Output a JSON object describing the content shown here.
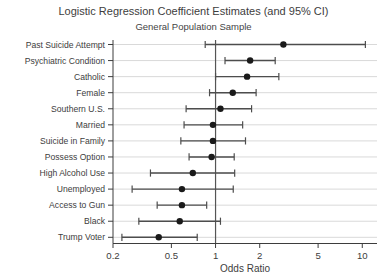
{
  "chart_data": {
    "type": "scatter",
    "subtype": "forest-plot",
    "title": "Logistic Regression Coefficient Estimates (and 95% CI)",
    "subtitle": "General Population Sample",
    "xlabel": "Odds Ratio",
    "x_scale": "log",
    "x_tick_labels": [
      "0.2",
      "0.5",
      "1",
      "2",
      "5",
      "10"
    ],
    "x_tick_values": [
      0.2,
      0.5,
      1,
      2,
      5,
      10
    ],
    "xlim": [
      0.2,
      12.6
    ],
    "reference_line_x": 1,
    "grid": "horizontal",
    "legend": "none",
    "colors": {
      "point": "#1a1a1a",
      "ci_line": "#4d4d4d",
      "grid_line": "#d9d9d9",
      "axis": "#3d3d3d",
      "text": "#3d3d3d"
    },
    "series": [
      {
        "label": "Past Suicide Attempt",
        "odds_ratio": 2.9,
        "ci_low": 0.85,
        "ci_high": 10.5
      },
      {
        "label": "Psychiatric Condition",
        "odds_ratio": 1.72,
        "ci_low": 1.16,
        "ci_high": 2.55
      },
      {
        "label": "Catholic",
        "odds_ratio": 1.64,
        "ci_low": 1.0,
        "ci_high": 2.7
      },
      {
        "label": "Female",
        "odds_ratio": 1.31,
        "ci_low": 0.91,
        "ci_high": 1.89
      },
      {
        "label": "Southern U.S.",
        "odds_ratio": 1.08,
        "ci_low": 0.63,
        "ci_high": 1.76
      },
      {
        "label": "Married",
        "odds_ratio": 0.96,
        "ci_low": 0.61,
        "ci_high": 1.53
      },
      {
        "label": "Suicide in Family",
        "odds_ratio": 0.96,
        "ci_low": 0.58,
        "ci_high": 1.6
      },
      {
        "label": "Possess Option",
        "odds_ratio": 0.94,
        "ci_low": 0.66,
        "ci_high": 1.34
      },
      {
        "label": "High Alcohol Use",
        "odds_ratio": 0.7,
        "ci_low": 0.36,
        "ci_high": 1.35
      },
      {
        "label": "Unemployed",
        "odds_ratio": 0.59,
        "ci_low": 0.27,
        "ci_high": 1.32
      },
      {
        "label": "Access to Gun",
        "odds_ratio": 0.59,
        "ci_low": 0.4,
        "ci_high": 0.87
      },
      {
        "label": "Black",
        "odds_ratio": 0.57,
        "ci_low": 0.3,
        "ci_high": 1.08
      },
      {
        "label": "Trump Voter",
        "odds_ratio": 0.41,
        "ci_low": 0.23,
        "ci_high": 0.75
      }
    ]
  }
}
